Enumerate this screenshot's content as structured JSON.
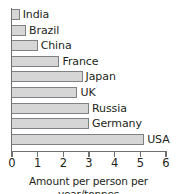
{
  "chart_data": {
    "type": "bar",
    "orientation": "horizontal",
    "title": "",
    "xlabel": "Amount per person per year/tonnes",
    "ylabel": "",
    "xlim": [
      0,
      6
    ],
    "xticks": [
      0,
      1,
      2,
      3,
      4,
      5,
      6
    ],
    "xtick_labels": [
      "0",
      "1",
      "2",
      "3",
      "4",
      "5",
      "6"
    ],
    "grid": false,
    "legend": null,
    "categories": [
      "India",
      "Brazil",
      "China",
      "France",
      "Japan",
      "UK",
      "Russia",
      "Germany",
      "USA"
    ],
    "values": [
      0.3,
      0.55,
      1.0,
      1.85,
      2.75,
      2.55,
      3.0,
      3.0,
      5.15
    ],
    "bars": [
      {
        "label": "India",
        "value": 0.3
      },
      {
        "label": "Brazil",
        "value": 0.55
      },
      {
        "label": "China",
        "value": 1.0
      },
      {
        "label": "France",
        "value": 1.85
      },
      {
        "label": "Japan",
        "value": 2.75
      },
      {
        "label": "UK",
        "value": 2.55
      },
      {
        "label": "Russia",
        "value": 3.0
      },
      {
        "label": "Germany",
        "value": 3.0
      },
      {
        "label": "USA",
        "value": 5.15
      }
    ],
    "colors": {
      "bar_fill": "#d6d6d6",
      "bar_stroke": "#808184",
      "axis": "#6f7072",
      "text": "#231f20",
      "background": "#ffffff"
    }
  }
}
